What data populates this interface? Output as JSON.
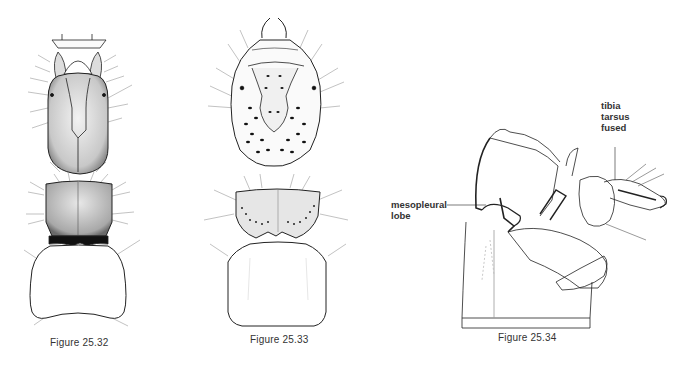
{
  "figures": [
    {
      "id": "25.32",
      "caption": "Figure 25.32"
    },
    {
      "id": "25.33",
      "caption": "Figure 25.33"
    },
    {
      "id": "25.34",
      "caption": "Figure 25.34",
      "labels": {
        "mesopleural_line1": "mesopleural",
        "mesopleural_line2": "lobe",
        "tibia": "tibia",
        "tarsus": "tarsus",
        "fused": "fused"
      }
    }
  ]
}
